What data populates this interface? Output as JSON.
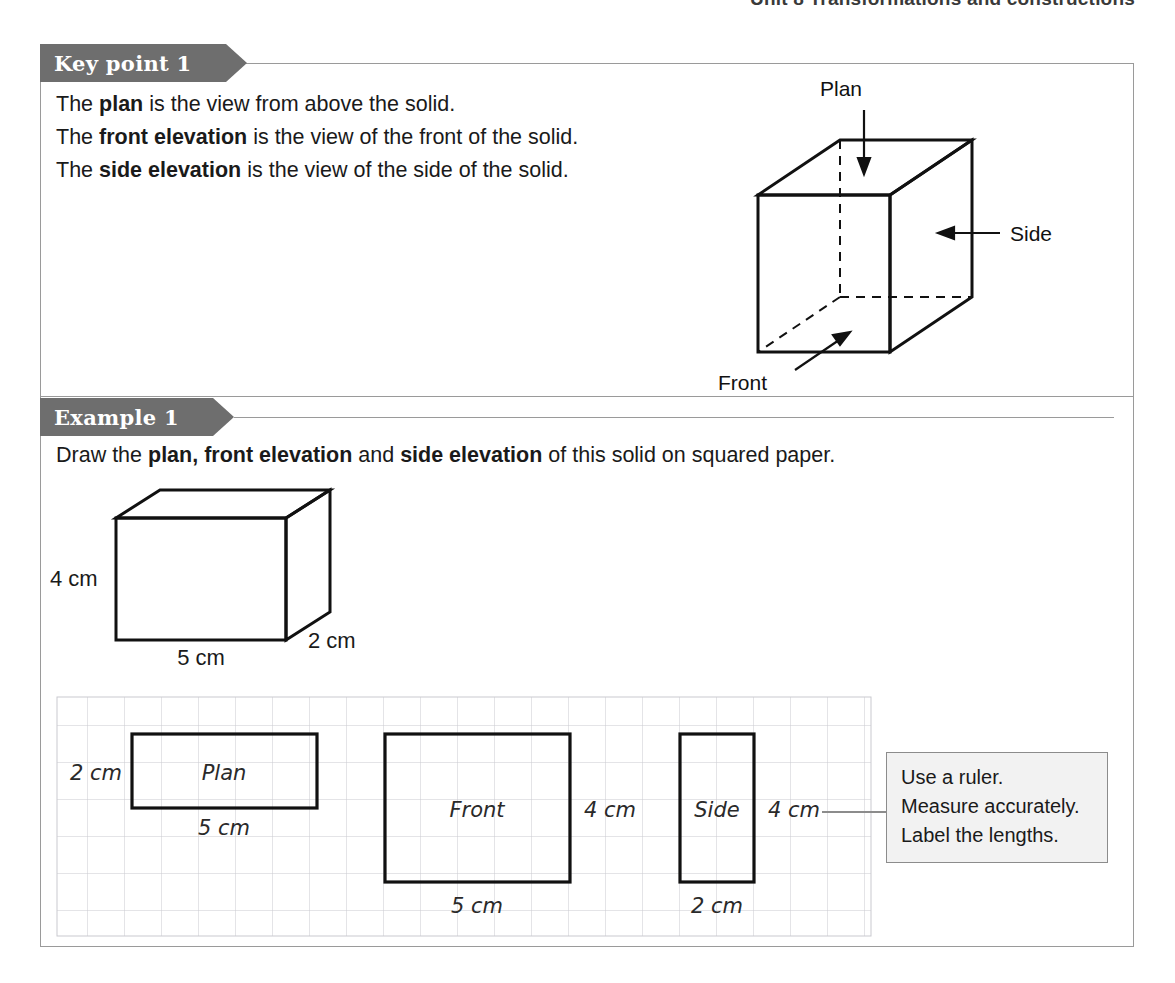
{
  "running_head": "Unit 8  Transformations and constructions",
  "keypoint": {
    "banner_label": "Key point 1",
    "lines": [
      {
        "prefix": "The ",
        "bold": "plan",
        "suffix": " is the view from above the solid."
      },
      {
        "prefix": "The ",
        "bold": "front elevation",
        "suffix": " is the view of the front of the solid."
      },
      {
        "prefix": "The ",
        "bold": "side elevation",
        "suffix": " is the view of the side of the solid."
      }
    ],
    "diagram": {
      "plan_label": "Plan",
      "side_label": "Side",
      "front_label": "Front"
    }
  },
  "example": {
    "banner_label": "Example 1",
    "instruction_parts": {
      "p1": "Draw the ",
      "b1": "plan, front elevation",
      "p2": " and ",
      "b2": "side elevation",
      "p3": " of this solid on squared paper."
    },
    "solid": {
      "height_label": "4 cm",
      "width_label": "5 cm",
      "depth_label": "2 cm"
    },
    "grid_views": [
      {
        "name": "Plan",
        "label": "Plan",
        "width_cm": 5,
        "height_cm": 2,
        "side_label": "2 cm",
        "bottom_label": "5 cm"
      },
      {
        "name": "Front",
        "label": "Front",
        "width_cm": 5,
        "height_cm": 4,
        "side_label": "4 cm",
        "bottom_label": "5 cm"
      },
      {
        "name": "Side",
        "label": "Side",
        "width_cm": 2,
        "height_cm": 4,
        "side_label": "4 cm",
        "bottom_label": "2 cm"
      }
    ],
    "hint": {
      "line1": "Use a ruler.",
      "line2": "Measure accurately.",
      "line3": "Label the lengths."
    }
  },
  "colors": {
    "banner_gray": "#6e6e6e",
    "card_border": "#9a9a9a",
    "grid_line": "#c9c9cf",
    "ink": "#111111",
    "hint_bg": "#f2f2f2",
    "hint_border": "#8c8c8c"
  }
}
